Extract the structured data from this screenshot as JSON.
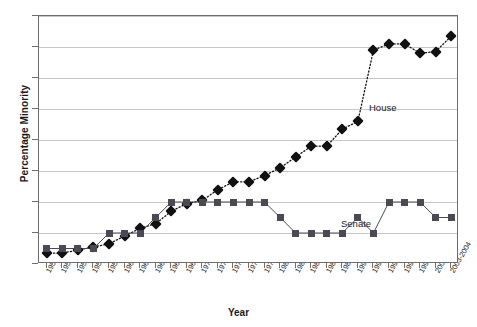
{
  "chart_data": {
    "type": "line",
    "title": "",
    "xlabel": "Year",
    "ylabel": "Percentage Minority",
    "ylim": [
      0,
      16
    ],
    "ytick_labels": [
      "0%",
      "2%",
      "4%",
      "6%",
      "8%",
      "10%",
      "12%",
      "14%",
      "16%"
    ],
    "ytick_values": [
      0,
      2,
      4,
      6,
      8,
      10,
      12,
      14,
      16
    ],
    "grid": true,
    "legend_position": "inline-annotation",
    "categories": [
      "1951-1952",
      "1953-1954",
      "1955-1956",
      "1957-1958",
      "1959-1960",
      "1961-1962",
      "1963-1964",
      "1965-1966",
      "1967-1968",
      "1969-1970",
      "1971-1972",
      "1973-1974",
      "1975-1976",
      "1977-1978",
      "1979-1980",
      "1981-1982",
      "1983-1984",
      "1985-1986",
      "1987-1988",
      "1989-1990",
      "1991-1992",
      "1993-1994",
      "1995-1996",
      "1997-1998",
      "1999-2000",
      "2001-2002",
      "2003-2004"
    ],
    "series": [
      {
        "name": "House",
        "marker": "diamond",
        "color": "#111111",
        "values": [
          0.7,
          0.7,
          0.9,
          1.1,
          1.3,
          1.8,
          2.3,
          2.6,
          3.4,
          3.9,
          4.1,
          4.8,
          5.3,
          5.3,
          5.7,
          6.2,
          6.9,
          7.6,
          7.6,
          8.7,
          9.2,
          13.8,
          14.2,
          14.2,
          13.6,
          13.7,
          14.7
        ]
      },
      {
        "name": "Senate",
        "marker": "square",
        "color": "#4a4a55",
        "values": [
          1.0,
          1.0,
          1.0,
          1.0,
          2.0,
          2.0,
          2.0,
          3.0,
          4.0,
          4.0,
          4.0,
          4.0,
          4.0,
          4.0,
          4.0,
          3.0,
          2.0,
          2.0,
          2.0,
          2.0,
          3.0,
          2.0,
          4.0,
          4.0,
          4.0,
          3.0,
          3.0
        ]
      }
    ],
    "annotations": [
      {
        "text": "House",
        "series": "House"
      },
      {
        "text": "Senate",
        "series": "Senate"
      }
    ]
  }
}
